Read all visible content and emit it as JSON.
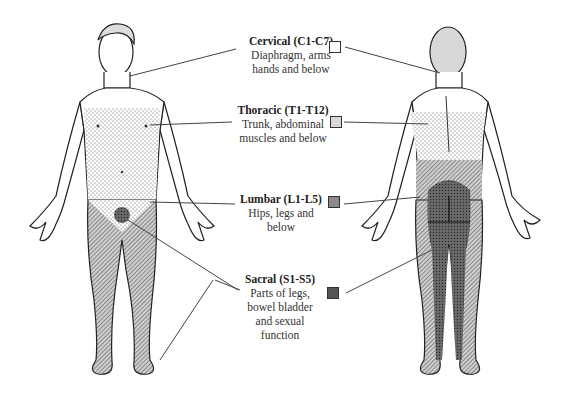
{
  "diagram": {
    "views": [
      {
        "name": "front",
        "label": ""
      },
      {
        "name": "back",
        "label": ""
      }
    ],
    "legend": [
      {
        "id": "cervical",
        "title": "Cervical (C1-C7)",
        "lines": [
          "Diaphragm, arms",
          "hands and below"
        ],
        "pattern": "blank",
        "color": "#ffffff"
      },
      {
        "id": "thoracic",
        "title": "Thoracic (T1-T12)",
        "lines": [
          "Trunk, abdominal",
          "muscles and below"
        ],
        "pattern": "light-stipple",
        "color": "#d8d8d8"
      },
      {
        "id": "lumbar",
        "title": "Lumbar (L1-L5)",
        "lines": [
          "Hips, legs and",
          "below"
        ],
        "pattern": "diagonal-hatch",
        "color": "#8a8a8a"
      },
      {
        "id": "sacral",
        "title": "Sacral (S1-S5)",
        "lines": [
          "Parts of legs,",
          "bowel bladder",
          "and sexual",
          "function"
        ],
        "pattern": "dense-crosshatch",
        "color": "#555555"
      }
    ]
  }
}
